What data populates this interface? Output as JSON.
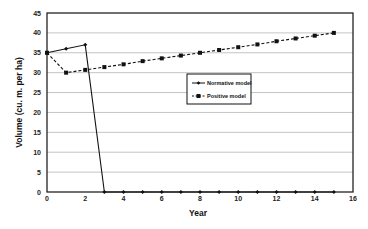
{
  "chart_data": {
    "type": "line",
    "title": "",
    "xlabel": "Year",
    "ylabel": "Volume (cu. m. per ha)",
    "xlim": [
      0,
      16
    ],
    "ylim": [
      0,
      45
    ],
    "xticks": [
      0,
      2,
      4,
      6,
      8,
      10,
      12,
      14,
      16
    ],
    "yticks": [
      0,
      5,
      10,
      15,
      20,
      25,
      30,
      35,
      40,
      45
    ],
    "grid": "horizontal",
    "legend_placement": "center-right",
    "series": [
      {
        "name": "Normative model",
        "line_style": "solid",
        "marker": "small-diamond",
        "x": [
          0,
          1,
          2,
          3,
          4,
          5,
          6,
          7,
          8,
          9,
          10,
          11,
          12,
          13,
          14,
          15
        ],
        "values": [
          35,
          36,
          37,
          0,
          0,
          0,
          0,
          0,
          0,
          0,
          0,
          0,
          0,
          0,
          0,
          0
        ]
      },
      {
        "name": "Positive model",
        "line_style": "dashed",
        "marker": "square",
        "x": [
          0,
          1,
          2,
          3,
          4,
          5,
          6,
          7,
          8,
          9,
          10,
          11,
          12,
          13,
          14,
          15
        ],
        "values": [
          35,
          30,
          30.7,
          31.4,
          32.1,
          32.9,
          33.6,
          34.3,
          35,
          35.7,
          36.4,
          37.1,
          37.9,
          38.6,
          39.3,
          40
        ]
      }
    ]
  }
}
